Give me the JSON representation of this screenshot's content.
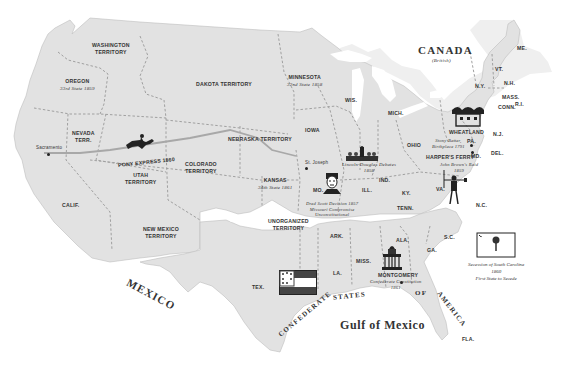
{
  "map": {
    "colors": {
      "land": "#e2e2e2",
      "border": "#9a9a9a",
      "route": "#a8a8a8",
      "water": "#ffffff",
      "text": "#333333"
    },
    "regions": {
      "canada": {
        "name": "CANADA",
        "sub": "(British)"
      },
      "mexico": "MEXICO",
      "gulf": "Gulf of Mexico",
      "confederacy": [
        "CONFEDERATE",
        "STATES",
        "OF",
        "AMERICA"
      ]
    },
    "territories": {
      "washington": [
        "WASHINGTON",
        "TERRITORY"
      ],
      "oregon": {
        "name": "OREGON",
        "note": "33rd State 1859"
      },
      "dakota": "DAKOTA TERRITORY",
      "minnesota": {
        "name": "MINNESOTA",
        "note": "32nd State 1858"
      },
      "nevada": [
        "NEVADA",
        "TERR."
      ],
      "nebraska": "NEBRASKA TERRITORY",
      "utah": [
        "UTAH",
        "TERRITORY"
      ],
      "colorado": [
        "COLORADO",
        "TERRITORY"
      ],
      "kansas": {
        "name": "KANSAS",
        "note": "34th State 1861"
      },
      "calif": "CALIF.",
      "new_mexico": [
        "NEW MEXICO",
        "TERRITORY"
      ],
      "unorganized": [
        "UNORGANIZED",
        "TERRITORY"
      ]
    },
    "states": {
      "wis": "WIS.",
      "mich": "MICH.",
      "iowa": "IOWA",
      "ohio": "OHIO",
      "ill": "ILL.",
      "ind": "IND.",
      "mo": "MO.",
      "ky": "KY.",
      "tenn": "TENN.",
      "va": "VA.",
      "nc": "N.C.",
      "sc": "S.C.",
      "ga": "GA.",
      "ala": "ALA.",
      "miss": "MISS.",
      "la": "LA.",
      "ark": "ARK.",
      "tex": "TEX.",
      "fla": "FLA.",
      "pa": "PA.",
      "md": "MD.",
      "del": "DEL.",
      "nj": "N.J.",
      "ny": "N.Y.",
      "vt": "VT.",
      "nh": "N.H.",
      "me": "ME.",
      "mass": "MASS.",
      "conn": "CONN.",
      "ri": "R.I."
    },
    "cities": {
      "sacramento": "Sacramento",
      "st_joseph": "St. Joseph",
      "wheatland": "WHEATLAND",
      "harpers_ferry": "HARPER'S FERRY",
      "montgomery": "MONTGOMERY"
    },
    "events": {
      "pony_express": "PONY EXPRESS 1860",
      "lincoln_douglas": [
        "Lincoln-Douglas Debates",
        "1858"
      ],
      "dred_scott": [
        "Dred Scott Decision 1857",
        "Missouri Compromise",
        "Unconstitutional"
      ],
      "harpers_ferry": [
        "John Brown's Raid",
        "1859"
      ],
      "bleeding_pa": [
        "Stony Batter,",
        "Birthplace 1791"
      ],
      "montgomery": [
        "Confederate Constitution",
        "1861"
      ],
      "sc_secession": [
        "Secession of South Carolina",
        "1860",
        "First State to Secede"
      ]
    },
    "icons": [
      "pony-express-rider-icon",
      "lincoln-douglas-debate-icon",
      "dred-scott-portrait-icon",
      "wheatland-house-icon",
      "john-brown-icon",
      "confederate-capitol-icon",
      "confederate-flag-icon",
      "south-carolina-flag-icon"
    ]
  }
}
